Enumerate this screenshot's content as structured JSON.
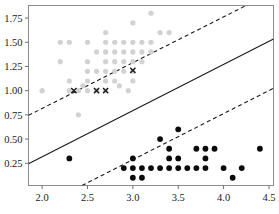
{
  "chart_data": {
    "type": "scatter",
    "title": "",
    "xlabel": "",
    "ylabel": "",
    "xlim": [
      1.85,
      4.55
    ],
    "ylim": [
      0.02,
      1.88
    ],
    "grid": false,
    "legend_position": "none",
    "xticks": [
      "2.0",
      "2.5",
      "3.0",
      "3.5",
      "4.0",
      "4.5"
    ],
    "xtick_values": [
      2.0,
      2.5,
      3.0,
      3.5,
      4.0,
      4.5
    ],
    "yticks": [
      "0.25",
      "0.50",
      "0.75",
      "1.00",
      "1.25",
      "1.50",
      "1.75"
    ],
    "ytick_values": [
      0.25,
      0.5,
      0.75,
      1.0,
      1.25,
      1.5,
      1.75
    ],
    "series": [
      {
        "name": "gray-circles",
        "marker": "circle",
        "color": "#d2d2d2",
        "size": 5.2,
        "points": [
          [
            2.0,
            1.0
          ],
          [
            2.2,
            1.5
          ],
          [
            2.2,
            1.3
          ],
          [
            2.3,
            1.5
          ],
          [
            2.3,
            1.1
          ],
          [
            2.3,
            1.0
          ],
          [
            2.4,
            1.0
          ],
          [
            2.5,
            1.5
          ],
          [
            2.5,
            1.3
          ],
          [
            2.5,
            1.2
          ],
          [
            2.5,
            1.1
          ],
          [
            2.5,
            1.0
          ],
          [
            2.6,
            1.4
          ],
          [
            2.6,
            1.2
          ],
          [
            2.6,
            1.0
          ],
          [
            2.7,
            1.6
          ],
          [
            2.7,
            1.5
          ],
          [
            2.7,
            1.4
          ],
          [
            2.7,
            1.3
          ],
          [
            2.7,
            1.2
          ],
          [
            2.7,
            1.1
          ],
          [
            2.7,
            1.0
          ],
          [
            2.8,
            1.5
          ],
          [
            2.8,
            1.4
          ],
          [
            2.8,
            1.3
          ],
          [
            2.8,
            1.2
          ],
          [
            2.8,
            1.1
          ],
          [
            2.9,
            1.5
          ],
          [
            2.9,
            1.4
          ],
          [
            2.9,
            1.3
          ],
          [
            2.9,
            1.2
          ],
          [
            3.0,
            1.7
          ],
          [
            3.0,
            1.5
          ],
          [
            3.0,
            1.4
          ],
          [
            3.0,
            1.3
          ],
          [
            3.0,
            1.2
          ],
          [
            3.0,
            1.1
          ],
          [
            3.1,
            1.5
          ],
          [
            3.1,
            1.4
          ],
          [
            3.1,
            1.3
          ],
          [
            3.2,
            1.8
          ],
          [
            3.2,
            1.5
          ],
          [
            3.2,
            1.4
          ],
          [
            3.3,
            1.6
          ],
          [
            3.4,
            1.6
          ],
          [
            2.4,
            0.75
          ],
          [
            2.85,
            1.05
          ],
          [
            2.95,
            1.0
          ],
          [
            2.45,
            1.05
          ]
        ]
      },
      {
        "name": "black-x-markers",
        "marker": "x",
        "color": "#1a1a1a",
        "size": 5,
        "points": [
          [
            2.35,
            1.0
          ],
          [
            2.6,
            1.0
          ],
          [
            2.7,
            1.0
          ],
          [
            3.0,
            1.21
          ]
        ]
      },
      {
        "name": "black-circles",
        "marker": "circle",
        "color": "#0a0a0a",
        "size": 5.8,
        "points": [
          [
            2.3,
            0.3
          ],
          [
            2.9,
            0.2
          ],
          [
            3.0,
            0.3
          ],
          [
            3.0,
            0.2
          ],
          [
            3.0,
            0.1
          ],
          [
            3.1,
            0.2
          ],
          [
            3.1,
            0.1
          ],
          [
            3.2,
            0.2
          ],
          [
            3.3,
            0.5
          ],
          [
            3.3,
            0.2
          ],
          [
            3.4,
            0.4
          ],
          [
            3.4,
            0.3
          ],
          [
            3.4,
            0.2
          ],
          [
            3.5,
            0.6
          ],
          [
            3.5,
            0.3
          ],
          [
            3.5,
            0.2
          ],
          [
            3.6,
            0.2
          ],
          [
            3.7,
            0.4
          ],
          [
            3.7,
            0.2
          ],
          [
            3.8,
            0.4
          ],
          [
            3.8,
            0.3
          ],
          [
            3.8,
            0.2
          ],
          [
            3.9,
            0.4
          ],
          [
            4.0,
            0.2
          ],
          [
            4.1,
            0.1
          ],
          [
            4.2,
            0.2
          ],
          [
            4.4,
            0.4
          ]
        ]
      }
    ],
    "lines": [
      {
        "name": "decision-boundary-solid",
        "style": "solid",
        "color": "#1a1a1a",
        "p1": [
          1.85,
          0.245
        ],
        "p2": [
          4.55,
          1.535
        ]
      },
      {
        "name": "upper-margin-dashed",
        "style": "dashed",
        "color": "#1a1a1a",
        "p1": [
          1.85,
          0.745
        ],
        "p2": [
          4.27,
          1.89
        ]
      },
      {
        "name": "lower-margin-dashed",
        "style": "dashed",
        "color": "#1a1a1a",
        "p1": [
          2.44,
          0.02
        ],
        "p2": [
          4.55,
          1.025
        ]
      }
    ]
  },
  "axes": {
    "frame_color": "#8c8c8c",
    "tick_color": "#6e6e6e"
  },
  "caption": {
    "text": ""
  }
}
